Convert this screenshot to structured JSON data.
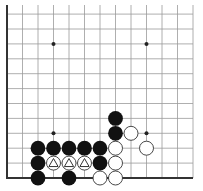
{
  "diagram": {
    "board": {
      "columns": 13,
      "rows": 12,
      "origin_x": 7,
      "origin_y": 178,
      "spacing_x": 15.5,
      "spacing_y": 14.9,
      "top_y": 5,
      "right_x": 193,
      "edges": [
        "left",
        "bottom"
      ],
      "line_color": "#9a9a9a",
      "edge_color": "#333333"
    },
    "star_points": [
      {
        "col": 3,
        "row": 3
      },
      {
        "col": 9,
        "row": 3
      },
      {
        "col": 3,
        "row": 9
      },
      {
        "col": 9,
        "row": 9
      }
    ],
    "stones": [
      {
        "color": "black",
        "col": 2,
        "row": 0
      },
      {
        "color": "black",
        "col": 4,
        "row": 0
      },
      {
        "color": "white",
        "col": 6,
        "row": 0
      },
      {
        "color": "white",
        "col": 7,
        "row": 0
      },
      {
        "color": "black",
        "col": 2,
        "row": 1
      },
      {
        "color": "white",
        "col": 3,
        "row": 1,
        "marker": "triangle"
      },
      {
        "color": "white",
        "col": 4,
        "row": 1,
        "marker": "triangle"
      },
      {
        "color": "white",
        "col": 5,
        "row": 1,
        "marker": "triangle"
      },
      {
        "color": "black",
        "col": 6,
        "row": 1
      },
      {
        "color": "white",
        "col": 7,
        "row": 1
      },
      {
        "color": "black",
        "col": 2,
        "row": 2
      },
      {
        "color": "black",
        "col": 3,
        "row": 2
      },
      {
        "color": "black",
        "col": 4,
        "row": 2
      },
      {
        "color": "black",
        "col": 5,
        "row": 2
      },
      {
        "color": "black",
        "col": 6,
        "row": 2
      },
      {
        "color": "white",
        "col": 7,
        "row": 2
      },
      {
        "color": "white",
        "col": 9,
        "row": 2
      },
      {
        "color": "black",
        "col": 7,
        "row": 3
      },
      {
        "color": "white",
        "col": 8,
        "row": 3
      },
      {
        "color": "black",
        "col": 7,
        "row": 4
      }
    ],
    "colors": {
      "black_stone": "#111111",
      "white_stone": "#ffffff",
      "white_stone_outline": "#333333",
      "marker": "#333333"
    }
  }
}
